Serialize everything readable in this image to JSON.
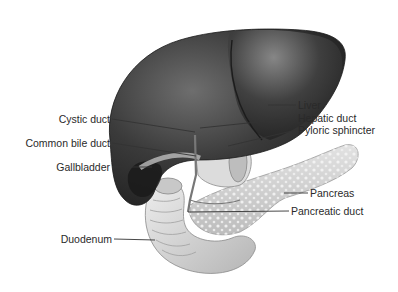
{
  "diagram": {
    "labels_left": [
      {
        "id": "cystic-duct",
        "text": "Cystic duct"
      },
      {
        "id": "common-bile-duct",
        "text": "Common bile duct"
      },
      {
        "id": "gallbladder",
        "text": "Gallbladder"
      },
      {
        "id": "duodenum",
        "text": "Duodenum"
      }
    ],
    "labels_right": [
      {
        "id": "liver",
        "text": "Liver"
      },
      {
        "id": "hepatic-duct",
        "text": "Hepatic duct"
      },
      {
        "id": "pyloric-sphincter",
        "text": "Pyloric sphincter"
      },
      {
        "id": "pancreas",
        "text": "Pancreas"
      },
      {
        "id": "pancreatic-duct",
        "text": "Pancreatic duct"
      }
    ],
    "colors": {
      "liver_dark": "#2e2e2e",
      "liver_light": "#6a6a6a",
      "organ_light": "#d8d8d8",
      "pancreas": "#cfcfcf",
      "leader_line": "#333333",
      "label_text": "#2a2a2a"
    }
  }
}
